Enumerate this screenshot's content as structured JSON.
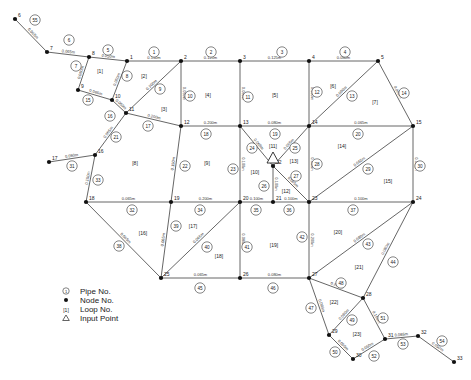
{
  "nodes": [
    {
      "id": "1",
      "x": 127,
      "y": 61
    },
    {
      "id": "2",
      "x": 181,
      "y": 61
    },
    {
      "id": "3",
      "x": 240,
      "y": 61
    },
    {
      "id": "4",
      "x": 309,
      "y": 61
    },
    {
      "id": "5",
      "x": 378,
      "y": 61
    },
    {
      "id": "6",
      "x": 15,
      "y": 19
    },
    {
      "id": "7",
      "x": 47,
      "y": 52
    },
    {
      "id": "8",
      "x": 89,
      "y": 57
    },
    {
      "id": "9",
      "x": 78,
      "y": 90
    },
    {
      "id": "10",
      "x": 112,
      "y": 100
    },
    {
      "id": "11",
      "x": 126,
      "y": 113
    },
    {
      "id": "12",
      "x": 181,
      "y": 126
    },
    {
      "id": "13",
      "x": 240,
      "y": 126
    },
    {
      "id": "14",
      "x": 309,
      "y": 126
    },
    {
      "id": "15",
      "x": 413,
      "y": 126
    },
    {
      "id": "16",
      "x": 95,
      "y": 155
    },
    {
      "id": "17",
      "x": 49,
      "y": 162
    },
    {
      "id": "18",
      "x": 86,
      "y": 202
    },
    {
      "id": "19",
      "x": 171,
      "y": 202
    },
    {
      "id": "20",
      "x": 240,
      "y": 202
    },
    {
      "id": "21",
      "x": 273,
      "y": 202
    },
    {
      "id": "22",
      "x": 273,
      "y": 166
    },
    {
      "id": "23",
      "x": 309,
      "y": 202
    },
    {
      "id": "24",
      "x": 413,
      "y": 202
    },
    {
      "id": "25",
      "x": 161,
      "y": 278
    },
    {
      "id": "26",
      "x": 240,
      "y": 278
    },
    {
      "id": "27",
      "x": 309,
      "y": 278
    },
    {
      "id": "28",
      "x": 363,
      "y": 298
    },
    {
      "id": "29",
      "x": 329,
      "y": 335
    },
    {
      "id": "30",
      "x": 353,
      "y": 359
    },
    {
      "id": "31",
      "x": 385,
      "y": 339
    },
    {
      "id": "32",
      "x": 418,
      "y": 336
    },
    {
      "id": "33",
      "x": 454,
      "y": 362
    }
  ],
  "pipes": [
    {
      "no": "1",
      "from": "1",
      "to": "2",
      "d": "0.150m"
    },
    {
      "no": "2",
      "from": "2",
      "to": "3",
      "d": "0.125m"
    },
    {
      "no": "3",
      "from": "3",
      "to": "4",
      "d": "0.125m"
    },
    {
      "no": "4",
      "from": "4",
      "to": "5",
      "d": "0.080m"
    },
    {
      "no": "5",
      "from": "8",
      "to": "1",
      "d": "0.050m"
    },
    {
      "no": "6",
      "from": "7",
      "to": "8",
      "d": "0.065m"
    },
    {
      "no": "7",
      "from": "8",
      "to": "9",
      "d": "0.050m"
    },
    {
      "no": "8",
      "from": "1",
      "to": "10",
      "d": "0.050m"
    },
    {
      "no": "9",
      "from": "11",
      "to": "2",
      "d": "0.100m"
    },
    {
      "no": "10",
      "from": "2",
      "to": "12",
      "d": "0.050m"
    },
    {
      "no": "11",
      "from": "3",
      "to": "13",
      "d": "0.080m"
    },
    {
      "no": "12",
      "from": "4",
      "to": "14",
      "d": "0.080m"
    },
    {
      "no": "13",
      "from": "14",
      "to": "5",
      "d": "0.080m"
    },
    {
      "no": "14",
      "from": "5",
      "to": "15",
      "d": "0.080m"
    },
    {
      "no": "15",
      "from": "9",
      "to": "10",
      "d": "0.065m"
    },
    {
      "no": "16",
      "from": "10",
      "to": "11",
      "d": "0.050m"
    },
    {
      "no": "17",
      "from": "11",
      "to": "12",
      "d": "0.200m"
    },
    {
      "no": "18",
      "from": "12",
      "to": "13",
      "d": "0.200m"
    },
    {
      "no": "19",
      "from": "13",
      "to": "14",
      "d": "0.080m"
    },
    {
      "no": "20",
      "from": "14",
      "to": "15",
      "d": "0.065m"
    },
    {
      "no": "21",
      "from": "11",
      "to": "16",
      "d": "0.065m"
    },
    {
      "no": "22",
      "from": "12",
      "to": "19",
      "d": "0.150m"
    },
    {
      "no": "23",
      "from": "13",
      "to": "20",
      "d": "0.100m"
    },
    {
      "no": "24",
      "from": "13",
      "to": "22",
      "d": "0.065m"
    },
    {
      "no": "25",
      "from": "22",
      "to": "14",
      "d": "0.065m"
    },
    {
      "no": "26",
      "from": "22",
      "to": "21",
      "d": "0.100m"
    },
    {
      "no": "27",
      "from": "22",
      "to": "23",
      "d": "0.065m"
    },
    {
      "no": "28",
      "from": "14",
      "to": "23",
      "d": "0.080m"
    },
    {
      "no": "29",
      "from": "23",
      "to": "15",
      "d": "0.065m"
    },
    {
      "no": "30",
      "from": "15",
      "to": "24",
      "d": "0.050m"
    },
    {
      "no": "31",
      "from": "17",
      "to": "16",
      "d": "0.050m"
    },
    {
      "no": "32",
      "from": "18",
      "to": "19",
      "d": "0.065m"
    },
    {
      "no": "33",
      "from": "16",
      "to": "18",
      "d": "0.150m"
    },
    {
      "no": "34",
      "from": "19",
      "to": "20",
      "d": "0.200m"
    },
    {
      "no": "35",
      "from": "20",
      "to": "21",
      "d": "0.100m"
    },
    {
      "no": "36",
      "from": "21",
      "to": "23",
      "d": "0.100m"
    },
    {
      "no": "37",
      "from": "23",
      "to": "24",
      "d": "0.100m"
    },
    {
      "no": "38",
      "from": "18",
      "to": "25",
      "d": "0.065m"
    },
    {
      "no": "39",
      "from": "19",
      "to": "25",
      "d": "0.065m"
    },
    {
      "no": "40",
      "from": "25",
      "to": "20",
      "d": "0.065m"
    },
    {
      "no": "41",
      "from": "20",
      "to": "26",
      "d": "0.080m"
    },
    {
      "no": "42",
      "from": "23",
      "to": "27",
      "d": "0.200m"
    },
    {
      "no": "43",
      "from": "27",
      "to": "24",
      "d": "0.080m"
    },
    {
      "no": "44",
      "from": "24",
      "to": "28",
      "d": "0.080m"
    },
    {
      "no": "45",
      "from": "25",
      "to": "26",
      "d": "0.065m"
    },
    {
      "no": "46",
      "from": "26",
      "to": "27",
      "d": "0.080m"
    },
    {
      "no": "47",
      "from": "27",
      "to": "29",
      "d": "0.065m"
    },
    {
      "no": "48",
      "from": "27",
      "to": "28",
      "d": "0.200m"
    },
    {
      "no": "49",
      "from": "29",
      "to": "28",
      "d": "0.080m"
    },
    {
      "no": "50",
      "from": "29",
      "to": "30",
      "d": "0.050m"
    },
    {
      "no": "51",
      "from": "28",
      "to": "31",
      "d": "0.150m"
    },
    {
      "no": "52",
      "from": "30",
      "to": "31",
      "d": "0.050m"
    },
    {
      "no": "53",
      "from": "31",
      "to": "32",
      "d": "0.065m"
    },
    {
      "no": "54",
      "from": "32",
      "to": "33",
      "d": "0.050m"
    },
    {
      "no": "55",
      "from": "6",
      "to": "7",
      "d": "0.065m"
    }
  ],
  "pipe_labels": [
    {
      "no": "1",
      "x": 154,
      "y": 52
    },
    {
      "no": "2",
      "x": 211,
      "y": 52
    },
    {
      "no": "3",
      "x": 282,
      "y": 52
    },
    {
      "no": "4",
      "x": 345,
      "y": 52
    },
    {
      "no": "5",
      "x": 108,
      "y": 50
    },
    {
      "no": "6",
      "x": 69,
      "y": 40
    },
    {
      "no": "7",
      "x": 76,
      "y": 66
    },
    {
      "no": "8",
      "x": 127,
      "y": 76
    },
    {
      "no": "9",
      "x": 160,
      "y": 89
    },
    {
      "no": "10",
      "x": 190,
      "y": 96
    },
    {
      "no": "11",
      "x": 248,
      "y": 97
    },
    {
      "no": "12",
      "x": 317,
      "y": 92
    },
    {
      "no": "13",
      "x": 352,
      "y": 96
    },
    {
      "no": "14",
      "x": 404,
      "y": 93
    },
    {
      "no": "15",
      "x": 88,
      "y": 100
    },
    {
      "no": "16",
      "x": 110,
      "y": 116
    },
    {
      "no": "17",
      "x": 148,
      "y": 126
    },
    {
      "no": "18",
      "x": 206,
      "y": 134
    },
    {
      "no": "19",
      "x": 275,
      "y": 134
    },
    {
      "no": "20",
      "x": 358,
      "y": 134
    },
    {
      "no": "21",
      "x": 116,
      "y": 137
    },
    {
      "no": "22",
      "x": 185,
      "y": 166
    },
    {
      "no": "23",
      "x": 233,
      "y": 169
    },
    {
      "no": "24",
      "x": 252,
      "y": 148
    },
    {
      "no": "25",
      "x": 295,
      "y": 148
    },
    {
      "no": "26",
      "x": 264,
      "y": 186
    },
    {
      "no": "27",
      "x": 296,
      "y": 176
    },
    {
      "no": "28",
      "x": 317,
      "y": 164
    },
    {
      "no": "29",
      "x": 368,
      "y": 169
    },
    {
      "no": "30",
      "x": 420,
      "y": 166
    },
    {
      "no": "31",
      "x": 72,
      "y": 166
    },
    {
      "no": "32",
      "x": 132,
      "y": 210
    },
    {
      "no": "33",
      "x": 98,
      "y": 180
    },
    {
      "no": "34",
      "x": 200,
      "y": 210
    },
    {
      "no": "35",
      "x": 256,
      "y": 210
    },
    {
      "no": "36",
      "x": 289,
      "y": 210
    },
    {
      "no": "37",
      "x": 353,
      "y": 210
    },
    {
      "no": "38",
      "x": 119,
      "y": 246
    },
    {
      "no": "39",
      "x": 176,
      "y": 226
    },
    {
      "no": "40",
      "x": 207,
      "y": 247
    },
    {
      "no": "41",
      "x": 247,
      "y": 247
    },
    {
      "no": "42",
      "x": 302,
      "y": 237
    },
    {
      "no": "43",
      "x": 368,
      "y": 244
    },
    {
      "no": "44",
      "x": 393,
      "y": 262
    },
    {
      "no": "45",
      "x": 200,
      "y": 288
    },
    {
      "no": "46",
      "x": 273,
      "y": 288
    },
    {
      "no": "47",
      "x": 311,
      "y": 308
    },
    {
      "no": "48",
      "x": 341,
      "y": 283
    },
    {
      "no": "49",
      "x": 352,
      "y": 320
    },
    {
      "no": "50",
      "x": 335,
      "y": 352
    },
    {
      "no": "51",
      "x": 383,
      "y": 318
    },
    {
      "no": "52",
      "x": 374,
      "y": 356
    },
    {
      "no": "53",
      "x": 403,
      "y": 344
    },
    {
      "no": "54",
      "x": 442,
      "y": 341
    },
    {
      "no": "55",
      "x": 35,
      "y": 20
    }
  ],
  "loops": [
    {
      "no": "[1]",
      "x": 100,
      "y": 71
    },
    {
      "no": "[2]",
      "x": 144,
      "y": 76
    },
    {
      "no": "[3]",
      "x": 164,
      "y": 109
    },
    {
      "no": "[4]",
      "x": 208,
      "y": 95
    },
    {
      "no": "[5]",
      "x": 275,
      "y": 95
    },
    {
      "no": "[6]",
      "x": 333,
      "y": 86
    },
    {
      "no": "[7]",
      "x": 375,
      "y": 102
    },
    {
      "no": "[8]",
      "x": 135,
      "y": 163
    },
    {
      "no": "[9]",
      "x": 207,
      "y": 163
    },
    {
      "no": "[10]",
      "x": 255,
      "y": 172
    },
    {
      "no": "[11]",
      "x": 273,
      "y": 146
    },
    {
      "no": "[12]",
      "x": 286,
      "y": 191
    },
    {
      "no": "[13]",
      "x": 294,
      "y": 161
    },
    {
      "no": "[14]",
      "x": 342,
      "y": 146
    },
    {
      "no": "[15]",
      "x": 388,
      "y": 181
    },
    {
      "no": "[16]",
      "x": 143,
      "y": 233
    },
    {
      "no": "[17]",
      "x": 193,
      "y": 226
    },
    {
      "no": "[18]",
      "x": 219,
      "y": 256
    },
    {
      "no": "[19]",
      "x": 274,
      "y": 245
    },
    {
      "no": "[20]",
      "x": 338,
      "y": 232
    },
    {
      "no": "[21]",
      "x": 359,
      "y": 267
    },
    {
      "no": "[22]",
      "x": 334,
      "y": 302
    },
    {
      "no": "[23]",
      "x": 357,
      "y": 334
    }
  ],
  "input_point": {
    "node": "22",
    "x": 273,
    "y": 158
  },
  "legend": [
    {
      "symbol": "pipe-circle",
      "label": "Pipe No."
    },
    {
      "symbol": "node-dot",
      "label": "Node No."
    },
    {
      "symbol": "loop-bracket",
      "label": "Loop No.",
      "glyph": "[1]"
    },
    {
      "symbol": "input-triangle",
      "label": "Input Point"
    }
  ]
}
